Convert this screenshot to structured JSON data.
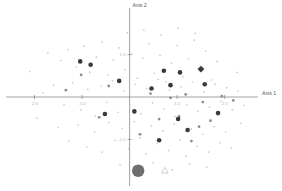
{
  "chart_data": {
    "type": "scatter",
    "title": "",
    "subtitle": "",
    "xlabel": "Axis 1",
    "ylabel": "Axis 2",
    "xlim": [
      -2.6,
      2.7
    ],
    "ylim": [
      -2.1,
      2.1
    ],
    "grid": false,
    "legend": "none",
    "x_ticks": [
      -2.0,
      -1.0,
      1.0,
      2.0
    ],
    "x_tick_labels": [
      "-2.0",
      "-1.0",
      "1.0",
      "2.0"
    ],
    "y_ticks": [
      -1.0,
      1.0
    ],
    "y_tick_labels": [
      "-1.0",
      "1.0"
    ],
    "series": [
      {
        "name": "background-cloud",
        "marker": "circle",
        "color": "#c9c9c9",
        "size": "tiny",
        "points": [
          [
            -1.72,
            1.04
          ],
          [
            -1.45,
            0.86
          ],
          [
            -1.3,
            1.12
          ],
          [
            -1.12,
            0.7
          ],
          [
            -0.96,
            1.2
          ],
          [
            -0.84,
            0.58
          ],
          [
            -0.7,
            0.94
          ],
          [
            -0.58,
            1.3
          ],
          [
            -0.46,
            0.52
          ],
          [
            -0.34,
            0.88
          ],
          [
            -0.22,
            1.16
          ],
          [
            -0.1,
            0.64
          ],
          [
            0.04,
            1.02
          ],
          [
            0.16,
            0.44
          ],
          [
            0.28,
            0.92
          ],
          [
            0.4,
            1.26
          ],
          [
            0.52,
            0.56
          ],
          [
            0.64,
            0.98
          ],
          [
            0.76,
            0.36
          ],
          [
            0.88,
            0.8
          ],
          [
            1.0,
            1.22
          ],
          [
            1.12,
            0.48
          ],
          [
            1.24,
            0.9
          ],
          [
            1.36,
            1.34
          ],
          [
            1.48,
            0.62
          ],
          [
            1.6,
            1.08
          ],
          [
            1.72,
            0.4
          ],
          [
            1.84,
            0.84
          ],
          [
            -1.6,
            0.28
          ],
          [
            -1.38,
            -0.18
          ],
          [
            -1.2,
            0.34
          ],
          [
            -1.02,
            -0.3
          ],
          [
            -0.88,
            0.18
          ],
          [
            -0.72,
            -0.44
          ],
          [
            -0.6,
            0.26
          ],
          [
            -0.48,
            -0.12
          ],
          [
            -0.36,
            0.38
          ],
          [
            -0.24,
            -0.36
          ],
          [
            -0.12,
            0.14
          ],
          [
            0.0,
            -0.22
          ],
          [
            0.12,
            0.3
          ],
          [
            0.24,
            -0.4
          ],
          [
            0.36,
            0.2
          ],
          [
            0.48,
            -0.14
          ],
          [
            0.6,
            0.42
          ],
          [
            0.72,
            -0.28
          ],
          [
            0.84,
            0.16
          ],
          [
            0.96,
            -0.46
          ],
          [
            1.08,
            0.24
          ],
          [
            1.2,
            -0.18
          ],
          [
            1.32,
            0.36
          ],
          [
            1.44,
            -0.34
          ],
          [
            1.56,
            0.12
          ],
          [
            1.68,
            -0.24
          ],
          [
            1.8,
            0.3
          ],
          [
            1.92,
            -0.1
          ],
          [
            2.04,
            0.22
          ],
          [
            2.16,
            -0.3
          ],
          [
            2.28,
            0.14
          ],
          [
            2.4,
            -0.2
          ],
          [
            -1.5,
            -0.72
          ],
          [
            -1.28,
            -1.04
          ],
          [
            -1.08,
            -0.66
          ],
          [
            -0.9,
            -1.18
          ],
          [
            -0.74,
            -0.82
          ],
          [
            -0.58,
            -1.3
          ],
          [
            -0.44,
            -0.6
          ],
          [
            -0.3,
            -1.02
          ],
          [
            -0.16,
            -0.74
          ],
          [
            -0.02,
            -1.22
          ],
          [
            0.1,
            -0.58
          ],
          [
            0.22,
            -0.96
          ],
          [
            0.34,
            -1.34
          ],
          [
            0.46,
            -0.68
          ],
          [
            0.58,
            -1.1
          ],
          [
            0.7,
            -0.8
          ],
          [
            0.82,
            -1.26
          ],
          [
            0.94,
            -0.64
          ],
          [
            1.06,
            -1.02
          ],
          [
            1.18,
            -1.4
          ],
          [
            1.3,
            -0.76
          ],
          [
            1.42,
            -1.16
          ],
          [
            1.54,
            -0.88
          ],
          [
            1.66,
            -1.3
          ],
          [
            1.78,
            -0.7
          ],
          [
            1.9,
            -1.08
          ],
          [
            2.02,
            -0.82
          ],
          [
            2.14,
            -1.2
          ],
          [
            -2.1,
            0.6
          ],
          [
            -1.95,
            -0.5
          ],
          [
            -1.82,
            0.1
          ],
          [
            -0.05,
            1.52
          ],
          [
            0.3,
            1.58
          ],
          [
            0.66,
            1.46
          ],
          [
            1.02,
            1.62
          ],
          [
            1.38,
            1.5
          ],
          [
            -0.2,
            -1.6
          ],
          [
            0.15,
            -1.68
          ],
          [
            0.5,
            -1.55
          ],
          [
            0.9,
            -1.72
          ],
          [
            1.26,
            -1.58
          ],
          [
            1.62,
            -1.66
          ],
          [
            2.26,
            0.58
          ],
          [
            2.34,
            -0.62
          ]
        ]
      },
      {
        "name": "mid-tone-points",
        "marker": "circle",
        "color": "#8e8e8e",
        "size": "small",
        "points": [
          [
            -1.02,
            0.52
          ],
          [
            -0.44,
            0.26
          ],
          [
            0.44,
            0.08
          ],
          [
            0.86,
            -0.02
          ],
          [
            1.18,
            0.06
          ],
          [
            1.54,
            -0.12
          ],
          [
            1.94,
            0.02
          ],
          [
            2.18,
            -0.08
          ],
          [
            0.62,
            -0.52
          ],
          [
            1.04,
            -0.46
          ],
          [
            1.46,
            -0.7
          ],
          [
            1.7,
            -0.56
          ],
          [
            -0.64,
            -0.48
          ],
          [
            -1.34,
            0.16
          ],
          [
            0.22,
            -0.88
          ],
          [
            1.3,
            -1.04
          ]
        ]
      },
      {
        "name": "emphasized-points",
        "marker": "circle",
        "color": "#3a3a3a",
        "size": "medium",
        "points": [
          [
            -1.04,
            0.84
          ],
          [
            -0.82,
            0.76
          ],
          [
            -0.22,
            0.38
          ],
          [
            0.72,
            0.62
          ],
          [
            1.06,
            0.58
          ],
          [
            0.86,
            0.28
          ],
          [
            0.46,
            0.2
          ],
          [
            -0.52,
            -0.4
          ],
          [
            0.1,
            -0.34
          ],
          [
            1.02,
            -0.52
          ],
          [
            1.22,
            -0.78
          ],
          [
            0.62,
            -1.02
          ],
          [
            1.58,
            0.3
          ],
          [
            1.86,
            -0.38
          ]
        ]
      },
      {
        "name": "large-diamond-point",
        "marker": "diamond",
        "color": "#3a3a3a",
        "size": "large",
        "points": [
          [
            1.5,
            0.66
          ]
        ]
      },
      {
        "name": "large-circle-outlier",
        "marker": "circle",
        "color": "#6e6e6e",
        "size": "xlarge",
        "points": [
          [
            0.18,
            -1.74
          ]
        ]
      },
      {
        "name": "triangle-marker",
        "marker": "triangle",
        "color": "#b9b9b9",
        "size": "medium",
        "points": [
          [
            0.74,
            -1.74
          ]
        ]
      }
    ]
  },
  "axes": {
    "x_title": "Axis 1",
    "y_title": "Axis 2"
  },
  "ticks": {
    "x": [
      {
        "label": "-2.0",
        "value": -2.0
      },
      {
        "label": "-1.0",
        "value": -1.0
      },
      {
        "label": "1.0",
        "value": 1.0
      },
      {
        "label": "2.0",
        "value": 2.0
      }
    ],
    "y": [
      {
        "label": "1.0",
        "value": 1.0
      },
      {
        "label": "-1.0",
        "value": -1.0
      }
    ]
  },
  "colors": {
    "axis": "#8a8a8a",
    "tick_text": "#b0b0b0",
    "title_text": "#555555",
    "point_faint": "#c9c9c9",
    "point_mid": "#8e8e8e",
    "point_dark": "#3a3a3a",
    "point_big": "#6e6e6e"
  }
}
